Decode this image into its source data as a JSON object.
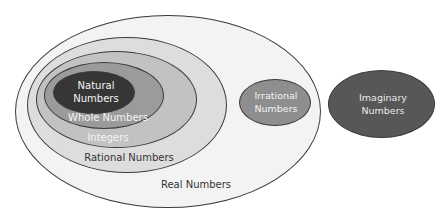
{
  "diagram": {
    "type": "nested-venn",
    "sets": {
      "real": {
        "label": "Real Numbers",
        "fill": "#f3f3f3",
        "text_color": "#333333"
      },
      "rational": {
        "label": "Rational Numbers",
        "fill": "#dddddd",
        "text_color": "#333333"
      },
      "integers": {
        "label": "Integers",
        "fill": "#c2c2c2",
        "text_color": "#f4f4f4"
      },
      "whole": {
        "label": "Whole Numbers",
        "fill": "#9b9b9b",
        "text_color": "#f4f4f4"
      },
      "natural": {
        "label_line1": "Natural",
        "label_line2": "Numbers",
        "fill": "#363636",
        "text_color": "#f4f4f4"
      },
      "irrational": {
        "label_line1": "Irrational",
        "label_line2": "Numbers",
        "fill": "#8e8e8e",
        "text_color": "#f4f4f4"
      },
      "imaginary": {
        "label_line1": "Imaginary",
        "label_line2": "Numbers",
        "fill": "#575757",
        "text_color": "#e8e8e8"
      }
    }
  }
}
